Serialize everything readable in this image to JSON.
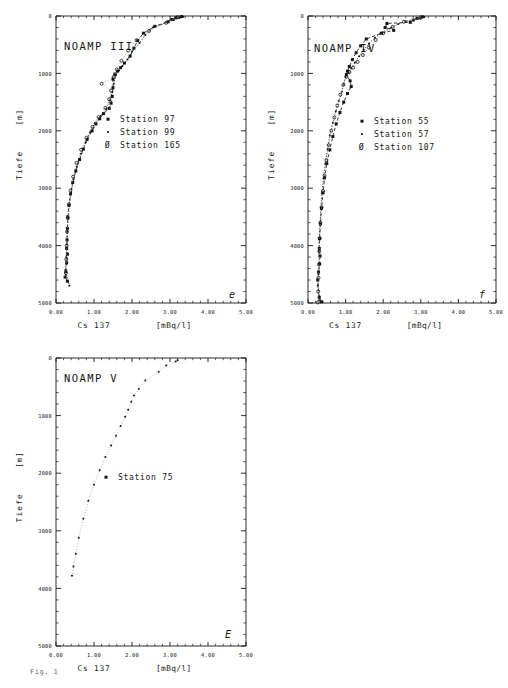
{
  "figure": {
    "caption_fragment": "Fig. 1",
    "axis": {
      "x_label_nuclide": "Cs 137",
      "x_label_unit": "[mBq/l]",
      "y_label_name": "Tiefe",
      "y_label_unit": "[m]",
      "x_ticks": [
        "0.00",
        "1.00",
        "2.00",
        "3.00",
        "4.00",
        "5.00"
      ],
      "y_ticks": [
        "0",
        "1000",
        "2000",
        "3000",
        "4000",
        "5000"
      ],
      "xlim": [
        0,
        5
      ],
      "ylim": [
        0,
        5000
      ],
      "x_minor_per_major": 5,
      "y_minor_per_major": 5
    }
  },
  "chart_data": [
    {
      "type": "scatter",
      "id": "noamp-3",
      "title": "NOAMP III",
      "panel_marker": "e",
      "xlabel": "Cs 137   [mBq/l]",
      "ylabel": "Tiefe   [m]",
      "xlim": [
        0,
        5
      ],
      "ylim": [
        0,
        5000
      ],
      "y_inverted": true,
      "grid": false,
      "legend_position": "center-right",
      "series": [
        {
          "name": "Station 97",
          "marker": "filled-square",
          "line": "dashed",
          "points": [
            [
              3.3,
              10
            ],
            [
              3.15,
              30
            ],
            [
              3.05,
              60
            ],
            [
              2.95,
              100
            ],
            [
              2.6,
              180
            ],
            [
              2.3,
              300
            ],
            [
              2.15,
              430
            ],
            [
              2.05,
              560
            ],
            [
              1.95,
              700
            ],
            [
              1.8,
              820
            ],
            [
              1.7,
              900
            ],
            [
              1.62,
              960
            ],
            [
              1.55,
              1010
            ],
            [
              1.5,
              1100
            ],
            [
              1.5,
              1250
            ],
            [
              1.48,
              1400
            ],
            [
              1.45,
              1520
            ],
            [
              1.4,
              1610
            ],
            [
              1.25,
              1700
            ],
            [
              1.15,
              1790
            ],
            [
              1.05,
              1880
            ],
            [
              0.95,
              2000
            ],
            [
              0.82,
              2150
            ],
            [
              0.72,
              2320
            ],
            [
              0.62,
              2500
            ],
            [
              0.52,
              2700
            ],
            [
              0.44,
              2900
            ],
            [
              0.38,
              3100
            ],
            [
              0.34,
              3300
            ],
            [
              0.31,
              3500
            ],
            [
              0.3,
              3700
            ],
            [
              0.29,
              3900
            ],
            [
              0.28,
              4050
            ],
            [
              0.3,
              4150
            ],
            [
              0.28,
              4300
            ],
            [
              0.26,
              4450
            ],
            [
              0.24,
              4550
            ],
            [
              0.3,
              4620
            ]
          ]
        },
        {
          "name": "Station 99",
          "marker": "small-dot",
          "line": "dotted",
          "points": [
            [
              3.35,
              12
            ],
            [
              3.25,
              35
            ],
            [
              3.1,
              70
            ],
            [
              2.55,
              200
            ],
            [
              2.35,
              330
            ],
            [
              2.2,
              470
            ],
            [
              2.0,
              620
            ],
            [
              1.88,
              760
            ],
            [
              1.75,
              870
            ],
            [
              1.66,
              950
            ],
            [
              1.58,
              1030
            ],
            [
              1.52,
              1180
            ],
            [
              1.48,
              1330
            ],
            [
              1.42,
              1470
            ],
            [
              1.32,
              1620
            ],
            [
              1.18,
              1740
            ],
            [
              1.02,
              1870
            ],
            [
              0.9,
              2020
            ],
            [
              0.78,
              2200
            ],
            [
              0.66,
              2400
            ],
            [
              0.55,
              2620
            ],
            [
              0.46,
              2850
            ],
            [
              0.4,
              3080
            ],
            [
              0.35,
              3300
            ],
            [
              0.32,
              3520
            ],
            [
              0.3,
              3750
            ],
            [
              0.29,
              3980
            ],
            [
              0.27,
              4200
            ],
            [
              0.25,
              4420
            ],
            [
              0.35,
              4700
            ]
          ]
        },
        {
          "name": "Station 165",
          "marker": "open-circle",
          "line": "light-dotted",
          "points": [
            [
              3.2,
              20
            ],
            [
              2.9,
              120
            ],
            [
              2.45,
              260
            ],
            [
              2.12,
              420
            ],
            [
              1.9,
              600
            ],
            [
              1.72,
              780
            ],
            [
              1.6,
              930
            ],
            [
              1.52,
              1060
            ],
            [
              1.2,
              1180
            ],
            [
              1.45,
              1300
            ],
            [
              1.4,
              1450
            ],
            [
              1.3,
              1600
            ],
            [
              1.12,
              1760
            ],
            [
              0.96,
              1930
            ],
            [
              0.8,
              2120
            ],
            [
              0.66,
              2330
            ],
            [
              0.54,
              2560
            ],
            [
              0.45,
              2800
            ],
            [
              0.38,
              3040
            ],
            [
              0.34,
              3280
            ],
            [
              0.31,
              3520
            ],
            [
              0.29,
              3760
            ],
            [
              0.28,
              4000
            ],
            [
              0.27,
              4240
            ],
            [
              0.26,
              4480
            ]
          ]
        }
      ]
    },
    {
      "type": "scatter",
      "id": "noamp-4",
      "title": "NOAMP IV",
      "panel_marker": "f",
      "xlabel": "Cs 137   [mBq/l]",
      "ylabel": "Tiefe   [m]",
      "xlim": [
        0,
        5
      ],
      "ylim": [
        0,
        5000
      ],
      "y_inverted": true,
      "grid": false,
      "legend_position": "center-right",
      "series": [
        {
          "name": "Station 55",
          "marker": "filled-square",
          "line": "dashed",
          "points": [
            [
              3.05,
              15
            ],
            [
              2.9,
              40
            ],
            [
              2.8,
              70
            ],
            [
              2.72,
              110
            ],
            [
              2.1,
              130
            ],
            [
              2.05,
              200
            ],
            [
              2.28,
              250
            ],
            [
              1.95,
              300
            ],
            [
              1.55,
              400
            ],
            [
              1.4,
              520
            ],
            [
              1.28,
              640
            ],
            [
              1.18,
              760
            ],
            [
              1.1,
              880
            ],
            [
              1.05,
              960
            ],
            [
              1.02,
              1020
            ],
            [
              1.12,
              1130
            ],
            [
              1.15,
              1230
            ],
            [
              1.05,
              1350
            ],
            [
              0.95,
              1500
            ],
            [
              0.85,
              1680
            ],
            [
              0.75,
              1880
            ],
            [
              0.66,
              2100
            ],
            [
              0.58,
              2330
            ],
            [
              0.5,
              2570
            ],
            [
              0.44,
              2820
            ],
            [
              0.4,
              3080
            ],
            [
              0.36,
              3350
            ],
            [
              0.33,
              3620
            ],
            [
              0.31,
              3880
            ],
            [
              0.3,
              4050
            ],
            [
              0.32,
              4180
            ],
            [
              0.31,
              4320
            ],
            [
              0.28,
              4460
            ],
            [
              0.26,
              4600
            ],
            [
              0.3,
              4900
            ],
            [
              0.36,
              4980
            ]
          ]
        },
        {
          "name": "Station 57",
          "marker": "small-dot",
          "line": "dotted",
          "points": [
            [
              3.1,
              18
            ],
            [
              2.95,
              45
            ],
            [
              2.6,
              90
            ],
            [
              2.4,
              140
            ],
            [
              2.2,
              210
            ],
            [
              1.95,
              290
            ],
            [
              1.78,
              380
            ],
            [
              1.62,
              480
            ],
            [
              1.48,
              590
            ],
            [
              1.36,
              700
            ],
            [
              1.25,
              810
            ],
            [
              1.15,
              910
            ],
            [
              1.08,
              990
            ],
            [
              1.0,
              1060
            ],
            [
              0.95,
              1180
            ],
            [
              0.9,
              1320
            ],
            [
              0.82,
              1480
            ],
            [
              0.74,
              1660
            ],
            [
              0.66,
              1860
            ],
            [
              0.58,
              2080
            ],
            [
              0.52,
              2320
            ],
            [
              0.46,
              2570
            ],
            [
              0.41,
              2830
            ],
            [
              0.37,
              3090
            ],
            [
              0.34,
              3360
            ],
            [
              0.32,
              3630
            ],
            [
              0.3,
              3890
            ],
            [
              0.29,
              4100
            ],
            [
              0.3,
              4300
            ],
            [
              0.28,
              4500
            ],
            [
              0.26,
              4700
            ],
            [
              0.3,
              4950
            ]
          ]
        },
        {
          "name": "Station 107",
          "marker": "open-circle",
          "line": "light-dotted",
          "points": [
            [
              3.0,
              25
            ],
            [
              2.55,
              100
            ],
            [
              2.25,
              190
            ],
            [
              2.0,
              300
            ],
            [
              1.8,
              420
            ],
            [
              1.62,
              550
            ],
            [
              1.46,
              680
            ],
            [
              1.32,
              800
            ],
            [
              1.2,
              900
            ],
            [
              1.1,
              980
            ],
            [
              1.02,
              1060
            ],
            [
              0.94,
              1200
            ],
            [
              0.86,
              1370
            ],
            [
              0.78,
              1560
            ],
            [
              0.7,
              1770
            ],
            [
              0.62,
              2000
            ],
            [
              0.55,
              2250
            ],
            [
              0.49,
              2510
            ],
            [
              0.44,
              2780
            ],
            [
              0.4,
              3050
            ],
            [
              0.36,
              3330
            ],
            [
              0.33,
              3600
            ],
            [
              0.31,
              3870
            ],
            [
              0.3,
              4100
            ],
            [
              0.29,
              4330
            ],
            [
              0.28,
              4560
            ],
            [
              0.27,
              4800
            ],
            [
              0.26,
              4990
            ]
          ]
        }
      ]
    },
    {
      "type": "scatter",
      "id": "noamp-5",
      "title": "NOAMP V",
      "panel_marker": "E",
      "xlabel": "Cs 137   [mBq/l]",
      "ylabel": "Tiefe   [m]",
      "xlim": [
        0,
        5
      ],
      "ylim": [
        0,
        5000
      ],
      "y_inverted": true,
      "grid": false,
      "legend_position": "center",
      "series": [
        {
          "name": "Station 75",
          "marker": "small-dot",
          "line": "light-dotted",
          "points": [
            [
              3.2,
              40
            ],
            [
              3.15,
              60
            ],
            [
              2.9,
              130
            ],
            [
              2.7,
              240
            ],
            [
              2.35,
              390
            ],
            [
              2.18,
              540
            ],
            [
              2.05,
              650
            ],
            [
              1.98,
              760
            ],
            [
              1.9,
              900
            ],
            [
              1.82,
              1020
            ],
            [
              1.7,
              1180
            ],
            [
              1.58,
              1350
            ],
            [
              1.45,
              1520
            ],
            [
              1.3,
              1720
            ],
            [
              1.15,
              1950
            ],
            [
              1.0,
              2200
            ],
            [
              0.85,
              2480
            ],
            [
              0.72,
              2790
            ],
            [
              0.6,
              3120
            ],
            [
              0.52,
              3400
            ],
            [
              0.46,
              3620
            ],
            [
              0.42,
              3780
            ]
          ]
        }
      ]
    }
  ],
  "legends": {
    "noamp3": [
      {
        "glyph": "▪",
        "label": "Station  97"
      },
      {
        "glyph": "·",
        "label": "Station  99"
      },
      {
        "glyph": "Ø",
        "label": "Station 165"
      }
    ],
    "noamp4": [
      {
        "glyph": "▪",
        "label": "Station  55"
      },
      {
        "glyph": "·",
        "label": "Station  57"
      },
      {
        "glyph": "Ø",
        "label": "Station 107"
      }
    ],
    "noamp5": [
      {
        "glyph": "▪",
        "label": "Station 75"
      }
    ]
  },
  "colors": {
    "ink": "#151515",
    "faint": "#9a9a9a",
    "paper": "#ffffff"
  }
}
